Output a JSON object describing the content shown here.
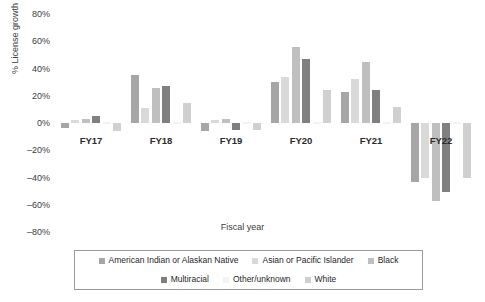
{
  "chart_data": {
    "type": "bar",
    "title": "",
    "xlabel": "Fiscal year",
    "ylabel": "% License growth",
    "categories": [
      "FY17",
      "FY18",
      "FY19",
      "FY20",
      "FY21",
      "FY22"
    ],
    "ylim": [
      -80,
      80
    ],
    "ytick_labels": [
      "80%",
      "60%",
      "40%",
      "20%",
      "0%",
      "–20%",
      "–40%",
      "–60%",
      "–80%"
    ],
    "ytick_values": [
      80,
      60,
      40,
      20,
      0,
      -20,
      -40,
      -60,
      -80
    ],
    "grid": false,
    "legend_position": "bottom",
    "series": [
      {
        "name": "American Indian or Alaskan Native",
        "color": "#a6a6a6",
        "values": [
          -4,
          35,
          -6,
          30,
          23,
          -43
        ]
      },
      {
        "name": "Asian or Pacific Islander",
        "color": "#d9d9d9",
        "values": [
          2,
          11,
          2,
          34,
          32,
          -40
        ]
      },
      {
        "name": "Black",
        "color": "#bfbfbf",
        "values": [
          3,
          26,
          3,
          56,
          45,
          -57
        ]
      },
      {
        "name": "Multiracial",
        "color": "#808080",
        "values": [
          5,
          27,
          -5,
          47,
          24,
          -51
        ]
      },
      {
        "name": "Other/unknown",
        "color": "#f2f2f2",
        "values": [
          0,
          0,
          0,
          0,
          0,
          0
        ]
      },
      {
        "name": "White",
        "color": "#d0d0d0",
        "values": [
          -6,
          15,
          -5,
          24,
          12,
          -40
        ]
      }
    ]
  },
  "legend": {
    "row1": [
      {
        "label": "American Indian or Alaskan Native",
        "color": "#a6a6a6"
      },
      {
        "label": "Asian or Pacific Islander",
        "color": "#d9d9d9"
      },
      {
        "label": "Black",
        "color": "#bfbfbf"
      }
    ],
    "row2": [
      {
        "label": "Multiracial",
        "color": "#808080"
      },
      {
        "label": "Other/unknown",
        "color": "#f2f2f2"
      },
      {
        "label": "White",
        "color": "#d0d0d0"
      }
    ]
  }
}
